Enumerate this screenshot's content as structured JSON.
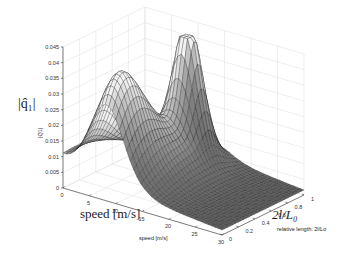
{
  "chart_data": {
    "type": "surface",
    "title": "",
    "overlay_labels": {
      "z": "|q̂₁|",
      "x": "speed [m/s]",
      "y": "2l/L₀"
    },
    "axis_labels": {
      "z": "|Q1|",
      "x": "speed [m/s]",
      "y": "relative length: 2l/Lo"
    },
    "x": {
      "name": "speed",
      "unit": "m/s",
      "range": [
        0,
        30
      ],
      "ticks": [
        "0",
        "5",
        "10",
        "15",
        "20",
        "25",
        "30"
      ],
      "tick_values": [
        0,
        5,
        10,
        15,
        20,
        25,
        30
      ]
    },
    "y": {
      "name": "relative length 2l/Lo",
      "range": [
        0,
        1
      ],
      "ticks": [
        "0",
        "0.2",
        "0.4",
        "0.6",
        "0.8",
        "1"
      ],
      "tick_values": [
        0,
        0.2,
        0.4,
        0.6,
        0.8,
        1
      ]
    },
    "z": {
      "name": "|Q1|",
      "range": [
        0,
        0.045
      ],
      "ticks": [
        "0",
        "0.005",
        "0.01",
        "0.015",
        "0.02",
        "0.025",
        "0.03",
        "0.035",
        "0.04",
        "0.045"
      ],
      "tick_values": [
        0,
        0.005,
        0.01,
        0.015,
        0.02,
        0.025,
        0.03,
        0.035,
        0.04,
        0.045
      ]
    },
    "grid": true,
    "colormap": "gray",
    "features": [
      {
        "description": "baseline level at low speed",
        "z": 0.01
      },
      {
        "description": "rounded peak",
        "x": 8,
        "y": 0.15,
        "z": 0.038
      },
      {
        "description": "sharp peak",
        "x": 12,
        "y": 0.75,
        "z": 0.045
      }
    ]
  }
}
